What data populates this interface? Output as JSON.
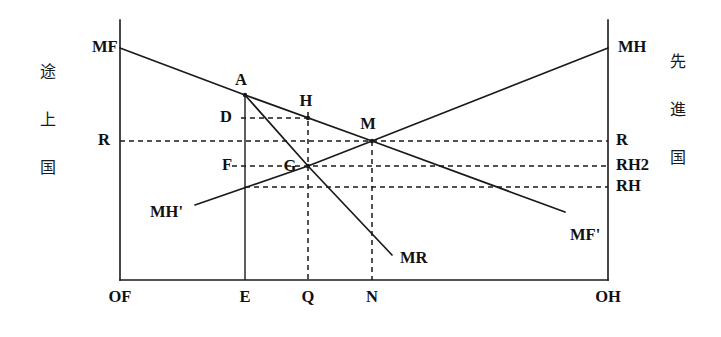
{
  "figure": {
    "type": "economics-line-diagram",
    "side_labels": {
      "left": {
        "chars": [
          "途",
          "上",
          "国"
        ],
        "meaning_order": "vertical"
      },
      "right": {
        "chars": [
          "先",
          "進",
          "国"
        ],
        "meaning_order": "vertical"
      }
    },
    "axis_endpoints": {
      "origin_left": "OF",
      "origin_right": "OH"
    },
    "x_ticks": [
      {
        "id": "OF",
        "label": "OF",
        "x": 120
      },
      {
        "id": "E",
        "label": "E",
        "x": 245
      },
      {
        "id": "Q",
        "label": "Q",
        "x": 308
      },
      {
        "id": "N",
        "label": "N",
        "x": 372
      },
      {
        "id": "OH",
        "label": "OH",
        "x": 608
      }
    ],
    "y_levels_right": [
      {
        "id": "R",
        "label": "R",
        "y": 141
      },
      {
        "id": "RH2",
        "label": "RH2",
        "y": 166
      },
      {
        "id": "RH",
        "label": "RH",
        "y": 187
      }
    ],
    "y_levels_left": [
      {
        "id": "R",
        "label": "R",
        "y": 141
      }
    ],
    "inner_level_labels": [
      {
        "id": "D",
        "label": "D",
        "x": 232,
        "y": 118
      },
      {
        "id": "F",
        "label": "F",
        "x": 232,
        "y": 166
      }
    ],
    "curves": [
      {
        "id": "MF",
        "label": "MF",
        "label_pos": {
          "x": 92,
          "y": 48
        },
        "points": [
          [
            120,
            48
          ],
          [
            245,
            95
          ],
          [
            372,
            141
          ],
          [
            565,
            212
          ]
        ],
        "style": "solid",
        "description": "downward sloping marginal product of capital for the developing country, measured from OF"
      },
      {
        "id": "MF_prime",
        "label": "MF'",
        "label_pos": {
          "x": 570,
          "y": 236
        },
        "points": [],
        "style": "solid",
        "description": "right-hand terminus label of the MF schedule"
      },
      {
        "id": "MH",
        "label": "MH",
        "label_pos": {
          "x": 618,
          "y": 48
        },
        "points": [
          [
            195,
            205
          ],
          [
            308,
            166
          ],
          [
            372,
            141
          ],
          [
            608,
            48
          ]
        ],
        "style": "solid",
        "description": "upward sloping marginal product of capital for the advanced country, measured from OH"
      },
      {
        "id": "MH_prime",
        "label": "MH'",
        "label_pos": {
          "x": 150,
          "y": 213
        },
        "points": [],
        "style": "solid",
        "description": "left-hand terminus label of the MH schedule"
      },
      {
        "id": "MR",
        "label": "MR",
        "label_pos": {
          "x": 400,
          "y": 259
        },
        "points": [
          [
            245,
            95
          ],
          [
            308,
            166
          ],
          [
            392,
            255
          ]
        ],
        "style": "solid",
        "description": "marginal revenue schedule starting at point A, passing through G"
      }
    ],
    "nodes": [
      {
        "id": "A",
        "label": "A",
        "x": 245,
        "y": 95,
        "label_dx": -4,
        "label_dy": -10
      },
      {
        "id": "H",
        "label": "H",
        "x": 308,
        "y": 118,
        "label_dx": -2,
        "label_dy": -12
      },
      {
        "id": "M",
        "label": "M",
        "x": 372,
        "y": 141,
        "label_dx": -4,
        "label_dy": -12
      },
      {
        "id": "G",
        "label": "G",
        "x": 308,
        "y": 166,
        "label_dx": -18,
        "label_dy": 5
      }
    ],
    "dashed_guides": [
      {
        "id": "guide-R",
        "x1": 120,
        "y1": 141,
        "x2": 608,
        "y2": 141
      },
      {
        "id": "guide-RH2",
        "x1": 232,
        "y1": 166,
        "x2": 608,
        "y2": 166
      },
      {
        "id": "guide-RH",
        "x1": 245,
        "y1": 187,
        "x2": 608,
        "y2": 187
      },
      {
        "id": "guide-D",
        "x1": 241,
        "y1": 118,
        "x2": 308,
        "y2": 118
      },
      {
        "id": "guide-Q",
        "x1": 308,
        "y1": 112,
        "x2": 308,
        "y2": 280
      },
      {
        "id": "guide-N",
        "x1": 372,
        "y1": 141,
        "x2": 372,
        "y2": 280
      }
    ],
    "solid_verticals": [
      {
        "id": "vert-E",
        "x": 245,
        "y1": 95,
        "y2": 280
      }
    ],
    "frame": {
      "left_x": 120,
      "right_x": 608,
      "top_y": 20,
      "bottom_y": 280
    }
  }
}
